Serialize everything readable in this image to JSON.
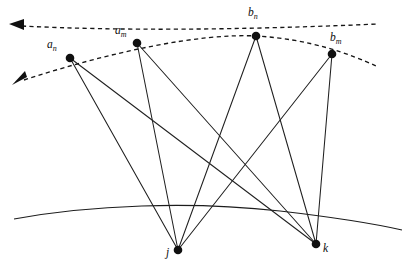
{
  "figure": {
    "kind": "geometry-diagram",
    "background_color": "#ffffff",
    "stroke_color": "#101010",
    "width": 407,
    "height": 274
  },
  "nodes": {
    "upper": [
      {
        "id": "a_n",
        "label_base": "a",
        "label_sub": "n",
        "x": 70,
        "y": 58,
        "label_x": 47,
        "label_y": 48
      },
      {
        "id": "a_m",
        "label_base": "a",
        "label_sub": "m",
        "x": 137,
        "y": 43,
        "label_x": 115,
        "label_y": 34
      },
      {
        "id": "b_n",
        "label_base": "b",
        "label_sub": "n",
        "x": 256,
        "y": 36,
        "label_x": 248,
        "label_y": 16
      },
      {
        "id": "b_m",
        "label_base": "b",
        "label_sub": "m",
        "x": 332,
        "y": 54,
        "label_x": 330,
        "label_y": 41
      }
    ],
    "lower": [
      {
        "id": "j",
        "label_base": "j",
        "label_sub": "",
        "x": 178,
        "y": 250,
        "label_x": 166,
        "label_y": 256
      },
      {
        "id": "k",
        "label_base": "k",
        "label_sub": "",
        "x": 316,
        "y": 244,
        "label_x": 323,
        "label_y": 252
      }
    ]
  },
  "edges": [
    {
      "from": "a_n",
      "to": "j"
    },
    {
      "from": "a_n",
      "to": "k"
    },
    {
      "from": "a_m",
      "to": "j"
    },
    {
      "from": "a_m",
      "to": "k"
    },
    {
      "from": "b_n",
      "to": "j"
    },
    {
      "from": "b_n",
      "to": "k"
    },
    {
      "from": "b_m",
      "to": "j"
    },
    {
      "from": "b_m",
      "to": "k"
    }
  ],
  "curves": {
    "dashed_upper": {
      "name": "upper-dashed-ray",
      "path": "M 22 26 C 120 31, 240 30, 378 24",
      "arrow_at": "left"
    },
    "dashed_lower": {
      "name": "lower-dashed-ray",
      "path": "M 24 80 C 110 52, 200 33, 256 36 C 310 39, 350 54, 376 66",
      "arrow_at": "left"
    },
    "solid_arc": {
      "name": "ground-arc",
      "path": "M 14 219 C 90 205, 190 201, 280 211 C 340 218, 380 225, 402 230"
    }
  },
  "arrows": [
    {
      "name": "upper-arrowhead",
      "points": "9,24 24,19 24,30",
      "tip_x": 9,
      "tip_y": 24
    },
    {
      "name": "lower-arrowhead",
      "points": "12,85 27,77 25,71",
      "tip_x": 12,
      "tip_y": 85
    }
  ]
}
